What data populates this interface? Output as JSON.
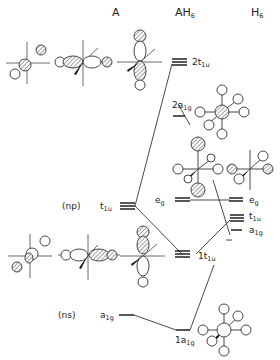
{
  "columns": {
    "left": "A",
    "middle": "AH",
    "middle_sub": "6",
    "right": "H",
    "right_sub": "6"
  },
  "left_levels": {
    "np_label": "(np)",
    "np_symmetry": "t",
    "np_sub": "1u",
    "ns_label": "(ns)",
    "ns_symmetry": "a",
    "ns_sub": "1g"
  },
  "middle_levels": {
    "2t1u": {
      "prefix": "2t",
      "sub": "1u"
    },
    "2a1g": {
      "prefix": "2a",
      "sub": "1g"
    },
    "eg": {
      "prefix": "e",
      "sub": "g"
    },
    "1t1u": {
      "prefix": "1t",
      "sub": "1u"
    },
    "1a1g": {
      "prefix": "1a",
      "sub": "1g"
    }
  },
  "right_levels": {
    "eg": {
      "prefix": "e",
      "sub": "g"
    },
    "t1u": {
      "prefix": "t",
      "sub": "1u"
    },
    "a1g": {
      "prefix": "a",
      "sub": "1g"
    }
  },
  "colors": {
    "ink": "#222222",
    "background": "#ffffff"
  }
}
